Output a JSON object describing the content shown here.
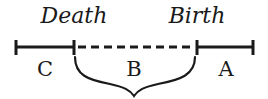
{
  "diagram": {
    "events": [
      {
        "label": "Death",
        "x": 74
      },
      {
        "label": "Birth",
        "x": 197
      }
    ],
    "segments": [
      {
        "label": "C",
        "style": "solid",
        "from": 16,
        "to": 74
      },
      {
        "label": "B",
        "style": "dashed",
        "from": 74,
        "to": 197
      },
      {
        "label": "A",
        "style": "solid",
        "from": 197,
        "to": 253
      }
    ],
    "brace_under": "B",
    "colors": {
      "ink": "#1a1a1a",
      "background": "#ffffff"
    }
  }
}
